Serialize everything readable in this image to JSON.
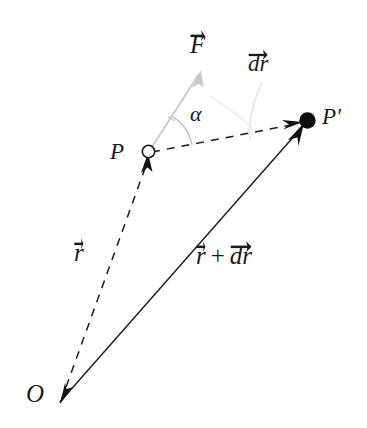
{
  "diagram": {
    "type": "vector-diagram",
    "background_color": "#ffffff",
    "ink_color": "#1a1a1a",
    "faint_color": "#cfcfcf",
    "labels": {
      "force": "F",
      "displacement": "dr",
      "angle": "α",
      "point_initial": "P",
      "point_final": "P′",
      "position_vector": "r",
      "position_vector_sum_first": "r",
      "position_vector_sum_operator": "+",
      "position_vector_sum_second": "dr",
      "origin": "O"
    },
    "points": {
      "O": {
        "label": "O",
        "x": 62,
        "y": 404,
        "marker": "none"
      },
      "P": {
        "label": "P",
        "x": 148,
        "y": 152,
        "marker": "open-circle"
      },
      "Pp": {
        "label": "P′",
        "x": 307,
        "y": 121,
        "marker": "filled-dot"
      },
      "F_tip": {
        "label": "F",
        "x": 201,
        "y": 71,
        "marker": "arrow"
      }
    },
    "vectors": [
      {
        "name": "r",
        "from": "O",
        "to": "P",
        "style": "dashed",
        "color": "#1a1a1a",
        "label": "r"
      },
      {
        "name": "r+dr",
        "from": "O",
        "to": "Pp",
        "style": "solid",
        "color": "#1a1a1a",
        "label": "r + dr"
      },
      {
        "name": "dr",
        "from": "P",
        "to": "Pp",
        "style": "dashed",
        "color": "#1a1a1a",
        "label": "dr"
      },
      {
        "name": "F",
        "from": "P",
        "to": "F_tip",
        "style": "solid",
        "color": "#cfcfcf",
        "label": "F"
      }
    ],
    "angle_arc": {
      "label": "α",
      "between": [
        "F",
        "dr"
      ],
      "vertex": "P"
    }
  }
}
